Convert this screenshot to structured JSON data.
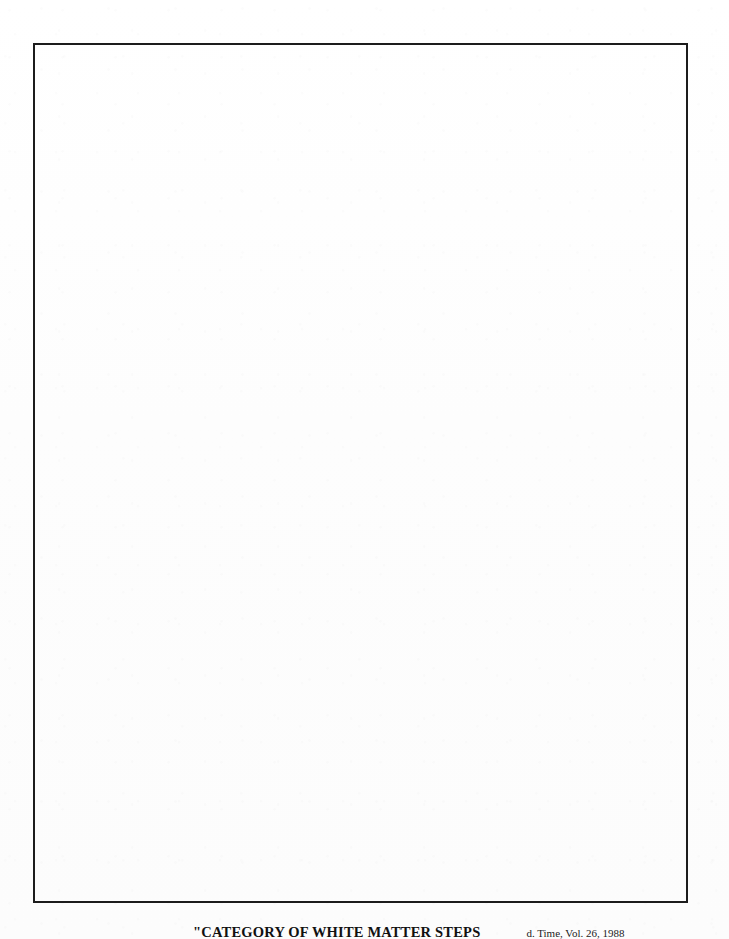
{
  "page": {
    "kind": "scanned-book-page",
    "background_color": "#fefefe",
    "width": 729,
    "height": 939
  },
  "plate": {
    "name": "empty-plate-frame",
    "border_color": "#1c1c1c",
    "border_width_px": 2,
    "fill_color": "#ffffff",
    "left_px": 33,
    "top_px": 43,
    "width_px": 655,
    "height_px": 860,
    "content": ""
  },
  "caption": {
    "title": "\"CATEGORY OF WHITE MATTER STEPS",
    "citation": "d. Time, Vol. 26, 1988"
  }
}
